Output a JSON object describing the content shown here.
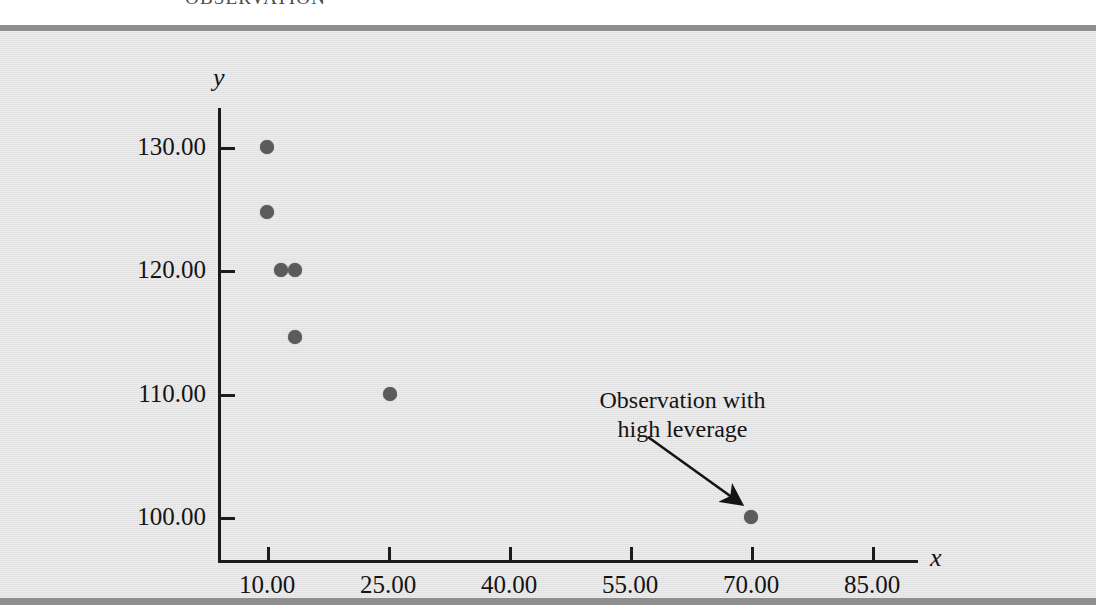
{
  "figure": {
    "cropped_caption": "OBSERVATION",
    "background_color": "#e4e4e4",
    "rule_color": "#8e8e8e",
    "point_color": "#5b5b5b",
    "axis_color": "#1b1b1b"
  },
  "chart_data": {
    "type": "scatter",
    "title": "",
    "xlabel": "x",
    "ylabel": "y",
    "xlim": [
      5,
      92.5
    ],
    "ylim": [
      96,
      133
    ],
    "grid": false,
    "legend": "none",
    "x_ticks": [
      10,
      25,
      40,
      55,
      70,
      85
    ],
    "x_ticklabels": [
      "10.00",
      "25.00",
      "40.00",
      "55.00",
      "70.00",
      "85.00"
    ],
    "y_ticks": [
      100,
      110,
      120,
      130
    ],
    "y_ticklabels": [
      "100.00",
      "110.00",
      "120.00",
      "130.00"
    ],
    "points": [
      {
        "x": 10.0,
        "y": 130.0
      },
      {
        "x": 10.0,
        "y": 124.7
      },
      {
        "x": 11.7,
        "y": 120.0
      },
      {
        "x": 13.5,
        "y": 120.0
      },
      {
        "x": 13.5,
        "y": 114.6
      },
      {
        "x": 25.2,
        "y": 110.0
      },
      {
        "x": 70.0,
        "y": 100.0
      }
    ],
    "annotations": [
      {
        "text_line_1": "Observation with",
        "text_line_2": "high leverage",
        "points_to": {
          "x": 70.0,
          "y": 100.0
        },
        "arrow": true
      }
    ]
  }
}
